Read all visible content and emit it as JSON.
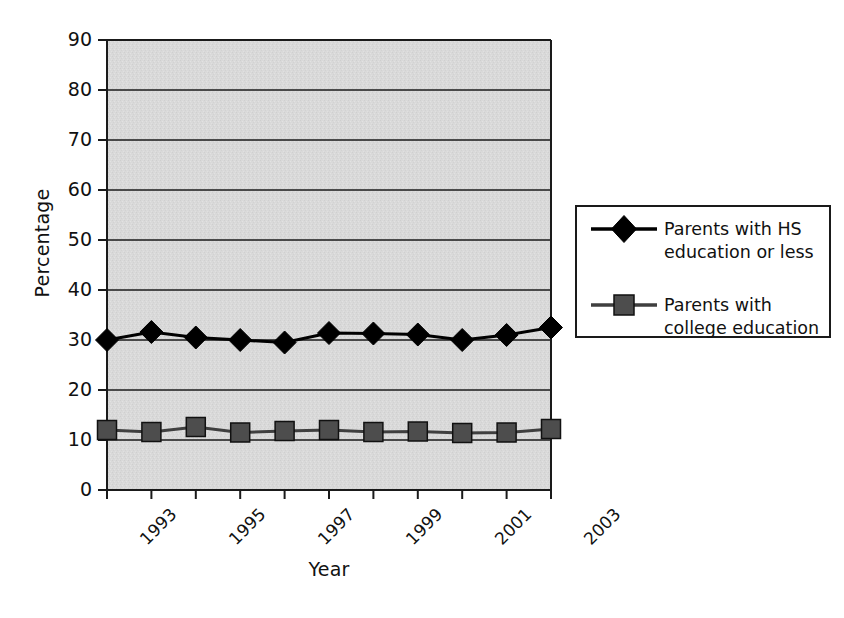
{
  "chart_data": {
    "type": "line",
    "title": "",
    "xlabel": "Year",
    "ylabel": "Percentage",
    "xlim": [
      1993,
      2003
    ],
    "ylim": [
      0,
      90
    ],
    "ytick_values": [
      0,
      10,
      20,
      30,
      40,
      50,
      60,
      70,
      80,
      90
    ],
    "ytick_labels": [
      "0",
      "10",
      "20",
      "30",
      "40",
      "50",
      "60",
      "70",
      "80",
      "90"
    ],
    "x": [
      1993,
      1994,
      1995,
      1996,
      1997,
      1998,
      1999,
      2000,
      2001,
      2002,
      2003
    ],
    "xtick_labels": [
      "1993",
      "",
      "1995",
      "",
      "1997",
      "",
      "1999",
      "",
      "2001",
      "",
      "2003"
    ],
    "xtick_labels_shown": [
      "1993",
      "1995",
      "1997",
      "1999",
      "2001",
      "2003"
    ],
    "grid": true,
    "grid_axis": "y",
    "legend_position": "right",
    "plot_background": "#d9d9d9",
    "series": [
      {
        "name": "Parents with HS education or less",
        "marker": "diamond",
        "color": "#000000",
        "marker_fill": "#000000",
        "values": [
          30.0,
          31.6,
          30.5,
          30.0,
          29.5,
          31.4,
          31.3,
          31.1,
          30.0,
          31.0,
          32.5
        ]
      },
      {
        "name": "Parents with college education",
        "marker": "square",
        "color": "#3f3f3f",
        "marker_fill": "#4d4d4d",
        "values": [
          12.0,
          11.6,
          12.6,
          11.5,
          11.8,
          12.0,
          11.6,
          11.7,
          11.4,
          11.5,
          12.2
        ]
      }
    ]
  },
  "legend": {
    "entries": [
      {
        "marker": "diamond-marker-icon",
        "line1": "Parents with HS",
        "line2": "education or less"
      },
      {
        "marker": "square-marker-icon",
        "line1": "Parents with",
        "line2": "college education"
      }
    ]
  },
  "axes": {
    "y_title": "Percentage",
    "x_title": "Year"
  }
}
